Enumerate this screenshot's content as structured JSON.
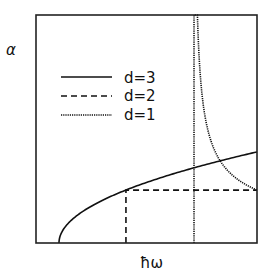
{
  "chart_data": {
    "type": "line",
    "title": "",
    "xlabel": "ħω",
    "ylabel": "α",
    "xlim": [
      0,
      1
    ],
    "ylim": [
      0,
      1
    ],
    "grid": false,
    "ticks": false,
    "legend": {
      "placement": "upper-left",
      "entries": [
        {
          "label": "d=3",
          "style": "solid"
        },
        {
          "label": "d=2",
          "style": "dashed"
        },
        {
          "label": "d=1",
          "style": "dotted"
        }
      ]
    },
    "series": [
      {
        "name": "d=3",
        "style": "solid",
        "model": "sqrt",
        "onset": 0.104,
        "coefficient": 0.422,
        "description": "α = 0.422·sqrt(ħω − 0.104) for ħω > 0.104"
      },
      {
        "name": "d=2",
        "style": "dashed",
        "model": "step",
        "onset": 0.407,
        "level": 0.232,
        "description": "α = 0.232 for ħω > 0.407"
      },
      {
        "name": "d=1",
        "style": "dotted",
        "model": "inverse-sqrt",
        "onset": 0.715,
        "coefficient": 0.124,
        "description": "α = 0.124/sqrt(ħω − 0.715) for ħω > 0.715"
      }
    ]
  }
}
